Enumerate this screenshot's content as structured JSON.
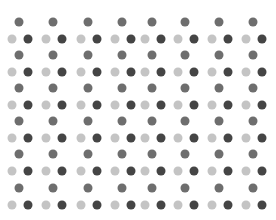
{
  "pattern": {
    "type": "dot-grid",
    "columns_top_x": [
      19,
      53,
      88,
      122,
      152,
      185,
      219,
      253
    ],
    "rows_top_y": [
      22,
      55,
      88,
      121,
      154,
      188
    ],
    "light_dx": -7,
    "dark_dx": 9,
    "pair_dy": 17,
    "dot_diameter": 9,
    "colors": {
      "top": "#6e6e6e",
      "light": "#c4c4c4",
      "dark": "#454545",
      "background": "#ffffff"
    }
  }
}
